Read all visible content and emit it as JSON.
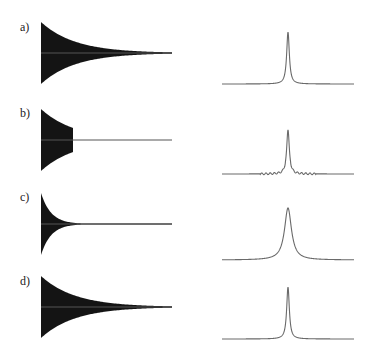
{
  "figure": {
    "panels": [
      {
        "label": "a)",
        "description": "Full exponentially decaying FID and its narrow Lorentzian spectrum",
        "fid": {
          "x0": 41,
          "center_y": 53,
          "half_height": 31,
          "end_x": 172,
          "decay_px": 34,
          "truncate_x": null
        },
        "spectrum": {
          "x0": 222,
          "x1": 354,
          "baseline_y": 84,
          "peak_x": 288,
          "peak_height": 52,
          "width_px": 1.6,
          "ripples": false
        }
      },
      {
        "label": "b)",
        "description": "Truncated FID producing sinc wiggles around the peak",
        "fid": {
          "x0": 41,
          "center_y": 140,
          "half_height": 31,
          "end_x": 172,
          "decay_px": 34,
          "truncate_x": 73
        },
        "spectrum": {
          "x0": 222,
          "x1": 354,
          "baseline_y": 174,
          "peak_x": 288,
          "peak_height": 52,
          "width_px": 1.6,
          "ripples": true
        }
      },
      {
        "label": "c)",
        "description": "Rapidly decaying FID (apodized) giving broader line",
        "fid": {
          "x0": 41,
          "center_y": 224,
          "half_height": 31,
          "end_x": 172,
          "decay_px": 10,
          "truncate_x": null
        },
        "spectrum": {
          "x0": 222,
          "x1": 354,
          "baseline_y": 260,
          "peak_x": 288,
          "peak_height": 52,
          "width_px": 4.2,
          "ripples": false
        }
      },
      {
        "label": "d)",
        "description": "Full FID again with narrow spectral line",
        "fid": {
          "x0": 41,
          "center_y": 307,
          "half_height": 31,
          "end_x": 172,
          "decay_px": 34,
          "truncate_x": null
        },
        "spectrum": {
          "x0": 222,
          "x1": 354,
          "baseline_y": 339,
          "peak_x": 288,
          "peak_height": 52,
          "width_px": 1.6,
          "ripples": false
        }
      }
    ],
    "label_positions": [
      {
        "x": 20,
        "y": 31
      },
      {
        "x": 20,
        "y": 117
      },
      {
        "x": 20,
        "y": 201
      },
      {
        "x": 20,
        "y": 285
      }
    ]
  }
}
